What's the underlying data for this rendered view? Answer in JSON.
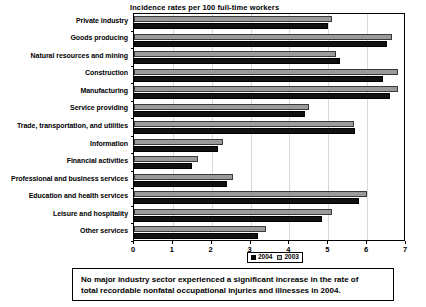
{
  "chart_data": {
    "type": "bar",
    "orientation": "horizontal",
    "title": "Incidence rates per 100 full-time workers",
    "xlabel": "",
    "ylabel": "",
    "xlim": [
      0,
      7
    ],
    "xticks": [
      0,
      1,
      2,
      3,
      4,
      5,
      6,
      7
    ],
    "grid": true,
    "legend_position": "bottom-center",
    "categories": [
      "Private industry",
      "Goods producing",
      "Natural resources and mining",
      "Construction",
      "Manufacturing",
      "Service providing",
      "Trade, transportation, and utilities",
      "Information",
      "Financial activities",
      "Professional and business services",
      "Education and health services",
      "Leisure and hospitality",
      "Other services"
    ],
    "series": [
      {
        "name": "2003",
        "color": "#9a9a9a",
        "values": [
          5.1,
          6.65,
          5.2,
          6.8,
          6.8,
          4.5,
          5.65,
          2.3,
          1.65,
          2.55,
          6.0,
          5.1,
          3.4
        ]
      },
      {
        "name": "2004",
        "color": "#111111",
        "values": [
          5.0,
          6.5,
          5.3,
          6.4,
          6.6,
          4.4,
          5.7,
          2.15,
          1.5,
          2.4,
          5.8,
          4.85,
          3.2
        ]
      }
    ]
  },
  "note": {
    "line1": "No major industry sector experienced a significant increase in the rate of",
    "line2": "total recordable nonfatal occupational injuries and illnesses in 2004."
  }
}
